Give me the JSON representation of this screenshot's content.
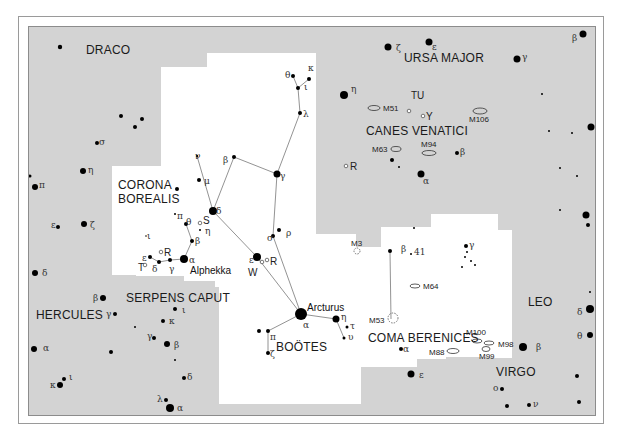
{
  "map": {
    "colors": {
      "background": "#d3d3d3",
      "highlight_region": "#ffffff",
      "star": "#000000",
      "line": "#777777",
      "text": "#1a1a1a"
    },
    "constellations": [
      {
        "id": "draco",
        "label": "DRACO",
        "x": 85,
        "y": 53
      },
      {
        "id": "ursa-major",
        "label": "URSA MAJOR",
        "x": 403,
        "y": 61
      },
      {
        "id": "canes-venatici",
        "label": "CANES VENATICI",
        "x": 365,
        "y": 134
      },
      {
        "id": "corona-borealis-1",
        "label": "CORONA",
        "x": 117,
        "y": 188
      },
      {
        "id": "corona-borealis-2",
        "label": "BOREALIS",
        "x": 117,
        "y": 202
      },
      {
        "id": "hercules",
        "label": "HERCULES",
        "x": 35,
        "y": 318
      },
      {
        "id": "serpens-caput",
        "label": "SERPENS CAPUT",
        "x": 125,
        "y": 301
      },
      {
        "id": "bootes",
        "label": "BOÖTES",
        "x": 275,
        "y": 350
      },
      {
        "id": "coma-berenices",
        "label": "COMA BERENICES",
        "x": 367,
        "y": 341
      },
      {
        "id": "leo",
        "label": "LEO",
        "x": 527,
        "y": 305
      },
      {
        "id": "virgo",
        "label": "VIRGO",
        "x": 495,
        "y": 375
      }
    ],
    "star_names": [
      {
        "label": "Arcturus",
        "x": 306,
        "y": 310
      },
      {
        "label": "Alphekka",
        "x": 189,
        "y": 273
      }
    ],
    "variable_stars": [
      {
        "label": "TU",
        "x": 410,
        "y": 98
      },
      {
        "label": "Y",
        "x": 427,
        "y": 115
      },
      {
        "label": "R",
        "x": 349,
        "y": 170
      },
      {
        "label": "S",
        "x": 204,
        "y": 224
      },
      {
        "label": "R",
        "x": 164,
        "y": 255
      },
      {
        "label": "T",
        "x": 137,
        "y": 270
      },
      {
        "label": "R",
        "x": 271,
        "y": 264
      },
      {
        "label": "W",
        "x": 247,
        "y": 275
      }
    ],
    "deep_sky": [
      {
        "label": "M51",
        "x": 382,
        "y": 110
      },
      {
        "label": "M106",
        "x": 468,
        "y": 121
      },
      {
        "label": "M63",
        "x": 371,
        "y": 150
      },
      {
        "label": "M94",
        "x": 420,
        "y": 146
      },
      {
        "label": "M3",
        "x": 350,
        "y": 245
      },
      {
        "label": "M64",
        "x": 422,
        "y": 288
      },
      {
        "label": "M53",
        "x": 368,
        "y": 322
      },
      {
        "label": "M100",
        "x": 465,
        "y": 334
      },
      {
        "label": "M98",
        "x": 497,
        "y": 346
      },
      {
        "label": "M99",
        "x": 478,
        "y": 358
      },
      {
        "label": "M88",
        "x": 428,
        "y": 354
      }
    ],
    "greek_labels": [
      {
        "t": "ζ",
        "x": 395,
        "y": 50
      },
      {
        "t": "ε",
        "x": 431,
        "y": 49
      },
      {
        "t": "γ",
        "x": 521,
        "y": 59
      },
      {
        "t": "β",
        "x": 571,
        "y": 40
      },
      {
        "t": "η",
        "x": 350,
        "y": 91
      },
      {
        "t": "β",
        "x": 459,
        "y": 154
      },
      {
        "t": "α",
        "x": 422,
        "y": 183
      },
      {
        "t": "θ",
        "x": 284,
        "y": 77
      },
      {
        "t": "κ",
        "x": 307,
        "y": 70
      },
      {
        "t": "ι",
        "x": 303,
        "y": 89
      },
      {
        "t": "λ",
        "x": 302,
        "y": 116
      },
      {
        "t": "β",
        "x": 222,
        "y": 162
      },
      {
        "t": "γ",
        "x": 279,
        "y": 178
      },
      {
        "t": "ν",
        "x": 194,
        "y": 158
      },
      {
        "t": "μ",
        "x": 203,
        "y": 183
      },
      {
        "t": "δ",
        "x": 215,
        "y": 213
      },
      {
        "t": "π",
        "x": 176,
        "y": 218
      },
      {
        "t": "θ",
        "x": 185,
        "y": 224
      },
      {
        "t": "η",
        "x": 204,
        "y": 233
      },
      {
        "t": "β",
        "x": 194,
        "y": 243
      },
      {
        "t": "ι",
        "x": 146,
        "y": 238
      },
      {
        "t": "α",
        "x": 188,
        "y": 262
      },
      {
        "t": "ε",
        "x": 141,
        "y": 260
      },
      {
        "t": "δ",
        "x": 151,
        "y": 271
      },
      {
        "t": "γ",
        "x": 168,
        "y": 271
      },
      {
        "t": "σ",
        "x": 266,
        "y": 240
      },
      {
        "t": "ρ",
        "x": 285,
        "y": 235
      },
      {
        "t": "ε",
        "x": 248,
        "y": 262
      },
      {
        "t": "α",
        "x": 302,
        "y": 327
      },
      {
        "t": "η",
        "x": 340,
        "y": 319
      },
      {
        "t": "τ",
        "x": 349,
        "y": 328
      },
      {
        "t": "υ",
        "x": 347,
        "y": 339
      },
      {
        "t": "π",
        "x": 269,
        "y": 339
      },
      {
        "t": "ζ",
        "x": 269,
        "y": 356
      },
      {
        "t": "σ",
        "x": 98,
        "y": 144
      },
      {
        "t": "η",
        "x": 87,
        "y": 172
      },
      {
        "t": "π",
        "x": 38,
        "y": 187
      },
      {
        "t": "ε",
        "x": 50,
        "y": 227
      },
      {
        "t": "ζ",
        "x": 89,
        "y": 227
      },
      {
        "t": "δ",
        "x": 41,
        "y": 275
      },
      {
        "t": "β",
        "x": 92,
        "y": 300
      },
      {
        "t": "γ",
        "x": 105,
        "y": 316
      },
      {
        "t": "ι",
        "x": 181,
        "y": 312
      },
      {
        "t": "κ",
        "x": 168,
        "y": 323
      },
      {
        "t": "γ",
        "x": 146,
        "y": 338
      },
      {
        "t": "β",
        "x": 173,
        "y": 347
      },
      {
        "t": "δ",
        "x": 186,
        "y": 379
      },
      {
        "t": "λ",
        "x": 156,
        "y": 401
      },
      {
        "t": "α",
        "x": 176,
        "y": 410
      },
      {
        "t": "α",
        "x": 42,
        "y": 350
      },
      {
        "t": "κ",
        "x": 49,
        "y": 387
      },
      {
        "t": "ι",
        "x": 68,
        "y": 379
      },
      {
        "t": "β",
        "x": 400,
        "y": 251
      },
      {
        "t": "41",
        "x": 413,
        "y": 254
      },
      {
        "t": "γ",
        "x": 468,
        "y": 247
      },
      {
        "t": "α",
        "x": 402,
        "y": 351
      },
      {
        "t": "ε",
        "x": 418,
        "y": 377
      },
      {
        "t": "β",
        "x": 535,
        "y": 349
      },
      {
        "t": "ο",
        "x": 492,
        "y": 390
      },
      {
        "t": "ν",
        "x": 532,
        "y": 406
      },
      {
        "t": "δ",
        "x": 576,
        "y": 314
      },
      {
        "t": "θ",
        "x": 576,
        "y": 338
      }
    ]
  }
}
